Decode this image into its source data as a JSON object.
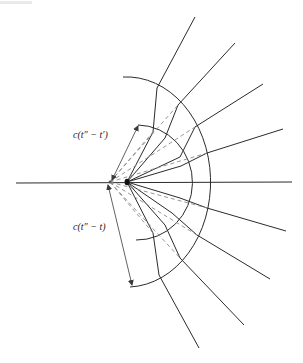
{
  "figure": {
    "header_fragment": "",
    "labels": {
      "upper": "c(t″ − t′)",
      "lower": "c(t″ − t)"
    },
    "colors": {
      "ink": "#2b2b2b",
      "dashed": "#8a8a8a",
      "background": "#ffffff"
    },
    "origin_main": [
      127,
      182
    ],
    "origin_secondary": [
      110,
      182
    ],
    "axis": {
      "from": [
        16,
        183
      ],
      "to": [
        292,
        182
      ]
    },
    "inner_arc": {
      "radius": 55,
      "from": [
        138,
        125
      ],
      "to": [
        136,
        240
      ]
    },
    "outer_arc": {
      "radius": 83,
      "from": [
        123,
        77
      ],
      "to": [
        130,
        287
      ]
    },
    "rays": [
      {
        "name": "ray-1",
        "points": [
          [
            127,
            182
          ],
          [
            153,
            132
          ],
          [
            157,
            88
          ],
          [
            195,
            17
          ]
        ]
      },
      {
        "name": "ray-2",
        "points": [
          [
            127,
            182
          ],
          [
            165,
            138
          ],
          [
            178,
            105
          ],
          [
            235,
            43
          ]
        ]
      },
      {
        "name": "ray-3",
        "points": [
          [
            127,
            182
          ],
          [
            180,
            157
          ],
          [
            195,
            127
          ],
          [
            263,
            84
          ]
        ]
      },
      {
        "name": "ray-4",
        "points": [
          [
            127,
            182
          ],
          [
            181,
            166
          ],
          [
            207,
            153
          ],
          [
            283,
            129
          ]
        ]
      },
      {
        "name": "ray-5",
        "points": [
          [
            127,
            182
          ],
          [
            180,
            198
          ],
          [
            207,
            208
          ],
          [
            286,
            231
          ]
        ]
      },
      {
        "name": "ray-6",
        "points": [
          [
            127,
            182
          ],
          [
            172,
            213
          ],
          [
            197,
            235
          ],
          [
            270,
            279
          ]
        ]
      },
      {
        "name": "ray-7",
        "points": [
          [
            127,
            182
          ],
          [
            165,
            225
          ],
          [
            180,
            258
          ],
          [
            244,
            325
          ]
        ]
      },
      {
        "name": "ray-8",
        "points": [
          [
            127,
            182
          ],
          [
            153,
            233
          ],
          [
            159,
            275
          ],
          [
            199,
            348
          ]
        ]
      }
    ],
    "dashed_lines": [
      {
        "from": [
          110,
          182
        ],
        "to": [
          153,
          132
        ]
      },
      {
        "from": [
          110,
          182
        ],
        "to": [
          178,
          105
        ]
      },
      {
        "from": [
          110,
          182
        ],
        "to": [
          195,
          127
        ]
      },
      {
        "from": [
          110,
          182
        ],
        "to": [
          207,
          153
        ]
      },
      {
        "from": [
          110,
          182
        ],
        "to": [
          207,
          208
        ]
      },
      {
        "from": [
          110,
          182
        ],
        "to": [
          197,
          235
        ]
      },
      {
        "from": [
          110,
          182
        ],
        "to": [
          180,
          258
        ]
      },
      {
        "from": [
          110,
          182
        ],
        "to": [
          153,
          233
        ]
      }
    ],
    "dimension_arrows": [
      {
        "name": "upper-arrow",
        "from": [
          112,
          180
        ],
        "to": [
          138,
          125
        ]
      },
      {
        "name": "lower-arrow",
        "from": [
          108,
          185
        ],
        "to": [
          132,
          286
        ]
      }
    ]
  }
}
